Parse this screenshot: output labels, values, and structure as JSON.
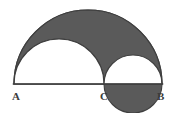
{
  "figure": {
    "canvas": {
      "width": 178,
      "height": 113,
      "background": "#ffffff"
    },
    "colors": {
      "shaded_fill": "#5a5a5a",
      "outline": "#3f3f3f",
      "unshaded_fill": "#ffffff",
      "label_color": "#3b3b3b"
    },
    "baseline": {
      "name": "segment-AB",
      "from": "A",
      "to": "B",
      "x1": 14,
      "y1": 84,
      "x2": 162,
      "y2": 84,
      "length": 148
    },
    "points": [
      {
        "id": "A",
        "label": "A",
        "x": 14,
        "y": 84
      },
      {
        "id": "C",
        "label": "C",
        "x": 104,
        "y": 84
      },
      {
        "id": "B",
        "label": "B",
        "x": 162,
        "y": 84
      }
    ],
    "semicircles": [
      {
        "id": "large",
        "name": "semicircle-on-AB",
        "diameter_from": "A",
        "diameter_to": "B",
        "center_x": 88,
        "center_y": 84,
        "radius": 74,
        "apex_y": 10,
        "shaded": true
      },
      {
        "id": "medium",
        "name": "semicircle-on-AC",
        "diameter_from": "A",
        "diameter_to": "C",
        "center_x": 59,
        "center_y": 84,
        "radius": 45,
        "apex_y": 39,
        "shaded": false
      },
      {
        "id": "small",
        "name": "semicircle-on-CB",
        "diameter_from": "C",
        "diameter_to": "B",
        "center_x": 133,
        "center_y": 84,
        "radius": 29,
        "apex_y": 55,
        "shaded": false
      }
    ],
    "shaded_region_description": "Region inside the large semicircle on AB but outside the semicircles on AC and CB"
  },
  "labels": {
    "a": "A",
    "c": "C",
    "b": "B"
  }
}
